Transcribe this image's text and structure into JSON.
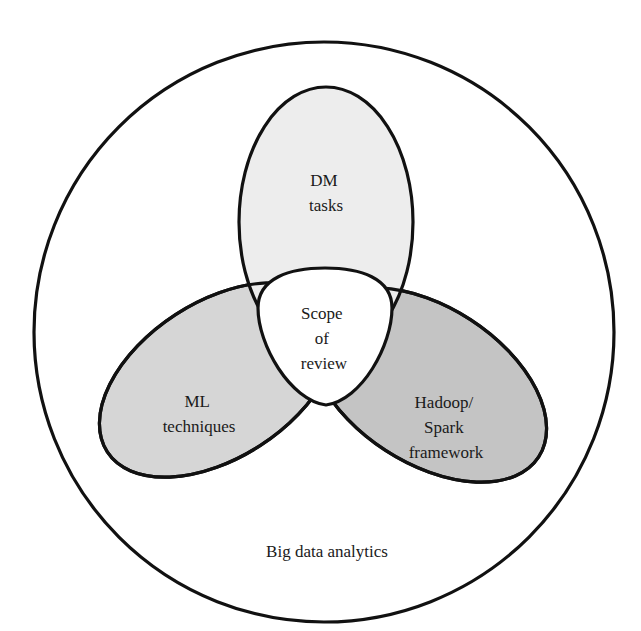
{
  "diagram": {
    "type": "venn",
    "outer": {
      "label": "Big data analytics",
      "fill": "#ffffff"
    },
    "sets": [
      {
        "id": "dm",
        "label_lines": [
          "DM",
          "tasks"
        ],
        "fill": "#ededed"
      },
      {
        "id": "ml",
        "label_lines": [
          "ML",
          "techniques"
        ],
        "fill": "#d6d6d6"
      },
      {
        "id": "hadoop",
        "label_lines": [
          "Hadoop/",
          "Spark",
          "framework"
        ],
        "fill": "#c2c2c2"
      }
    ],
    "center": {
      "label_lines": [
        "Scope",
        "of",
        "review"
      ],
      "fill": "#ffffff"
    },
    "stroke_color": "#111111"
  }
}
